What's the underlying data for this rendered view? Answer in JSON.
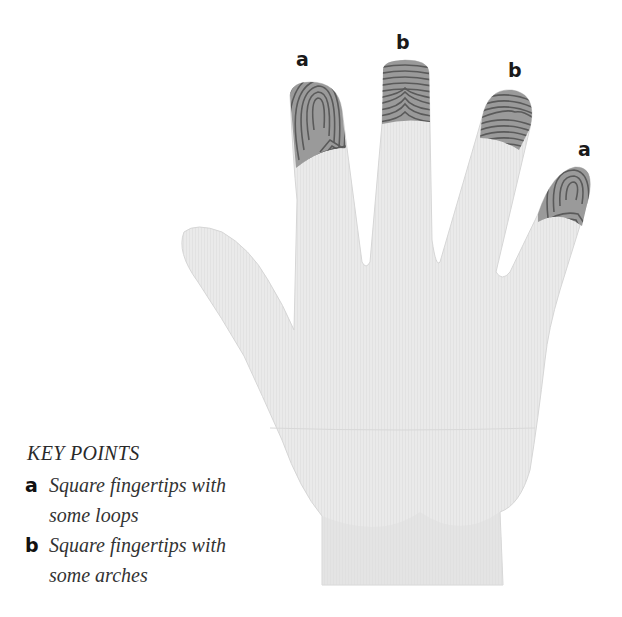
{
  "figure": {
    "colors": {
      "skin": "#e9e9e9",
      "skin_shadow": "#dcdcdc",
      "print_ridge": "#555555",
      "text": "#2a2a2a"
    }
  },
  "finger_labels": [
    {
      "finger": "index",
      "label": "a"
    },
    {
      "finger": "middle",
      "label": "b"
    },
    {
      "finger": "ring",
      "label": "b"
    },
    {
      "finger": "little",
      "label": "a"
    }
  ],
  "key": {
    "title": "KEY POINTS",
    "items": [
      {
        "letter": "a",
        "text": "Square fingertips with some loops"
      },
      {
        "letter": "b",
        "text": "Square fingertips with some arches"
      }
    ]
  }
}
